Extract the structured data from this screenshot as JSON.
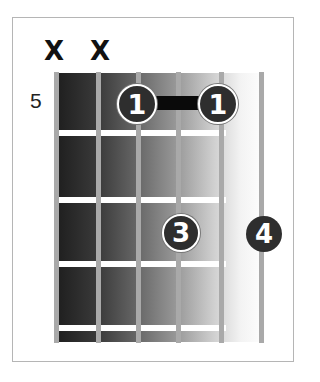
{
  "diagram": {
    "type": "guitar-chord-chart",
    "starting_fret": "5",
    "strings": 6,
    "frets_shown": 4,
    "muted_strings": [
      {
        "string": 6,
        "symbol": "X"
      },
      {
        "string": 5,
        "symbol": "X"
      }
    ],
    "fingers": [
      {
        "label": "1",
        "string": 4,
        "fret": 1
      },
      {
        "label": "1",
        "string": 2,
        "fret": 1
      },
      {
        "label": "3",
        "string": 3,
        "fret": 2
      },
      {
        "label": "4",
        "string": 1,
        "fret": 2
      }
    ],
    "barre": {
      "from_string": 4,
      "to_string": 2,
      "fret": 1,
      "finger": "1"
    },
    "caption": ""
  },
  "colors": {
    "finger_fill": "#2e2e2e",
    "finger_text": "#ffffff",
    "barre": "#0a0a0a",
    "string": "#a9a9a9",
    "fret": "#ffffff",
    "board_dark": "#1e1e1e",
    "board_light": "#ffffff"
  }
}
